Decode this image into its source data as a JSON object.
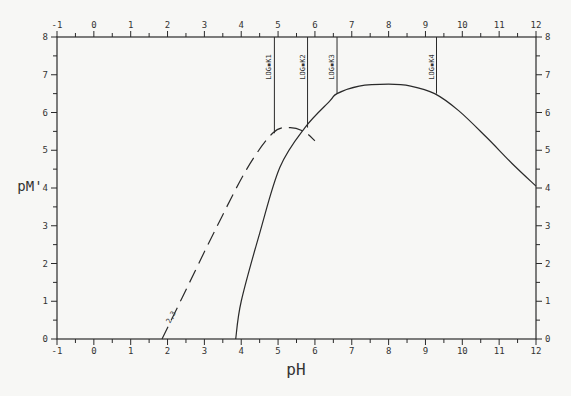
{
  "chart_data": {
    "type": "line",
    "title": "",
    "xlabel": "pH",
    "ylabel": "pM'",
    "xlim": [
      -1,
      12
    ],
    "ylim": [
      0,
      8
    ],
    "grid": false,
    "legend": "none",
    "x_ticks": [
      -1,
      0,
      1,
      2,
      3,
      4,
      5,
      6,
      7,
      8,
      9,
      10,
      11,
      12
    ],
    "y_ticks": [
      0,
      1,
      2,
      3,
      4,
      5,
      6,
      7,
      8
    ],
    "mirrored_axes": true,
    "series": [
      {
        "name": "solid curve",
        "style": "solid",
        "x": [
          3.85,
          4.0,
          4.5,
          5.05,
          5.73,
          6.4,
          6.6,
          7.2,
          8.0,
          8.6,
          9.25,
          9.9,
          10.65,
          11.35,
          12.0
        ],
        "y": [
          0.0,
          1.0,
          2.8,
          4.55,
          5.6,
          6.3,
          6.5,
          6.7,
          6.75,
          6.7,
          6.5,
          6.05,
          5.35,
          4.65,
          4.05
        ]
      },
      {
        "name": "dashed curve",
        "style": "dashed",
        "label": "2,3",
        "x": [
          1.85,
          2.4,
          3.3,
          4.15,
          4.85,
          5.3,
          5.7,
          6.0
        ],
        "y": [
          0.0,
          1.1,
          2.9,
          4.5,
          5.45,
          5.6,
          5.5,
          5.25
        ]
      }
    ],
    "annotations": [
      {
        "label": "LOG*K1",
        "x": 4.9,
        "y_top": 8,
        "y_bottom": 5.45
      },
      {
        "label": "LOG*K2",
        "x": 5.8,
        "y_top": 8,
        "y_bottom": 5.6
      },
      {
        "label": "LOG*K3",
        "x": 6.6,
        "y_top": 8,
        "y_bottom": 6.5
      },
      {
        "label": "LOG*K4",
        "x": 9.3,
        "y_top": 8,
        "y_bottom": 6.5
      }
    ]
  }
}
